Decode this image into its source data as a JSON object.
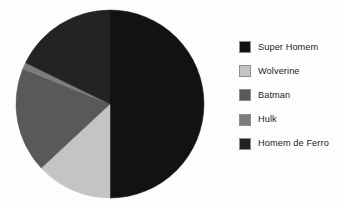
{
  "chart_data": {
    "type": "pie",
    "title": "",
    "categories": [
      "Super Homem",
      "Wolverine",
      "Batman",
      "Hulk",
      "Homem de Ferro"
    ],
    "values": [
      50,
      13,
      18,
      1,
      18
    ],
    "units": "percent",
    "start_angle_deg": 0,
    "direction": "clockwise",
    "legend_position": "right",
    "grid": false,
    "slices": [
      {
        "label": "Super Homem",
        "value": 50,
        "start_deg": 0,
        "end_deg": 180,
        "color": "#121212"
      },
      {
        "label": "Wolverine",
        "value": 13,
        "start_deg": 180,
        "end_deg": 227,
        "color": "#c4c4c4"
      },
      {
        "label": "Batman",
        "value": 18,
        "start_deg": 227,
        "end_deg": 292,
        "color": "#595959"
      },
      {
        "label": "Hulk",
        "value": 1,
        "start_deg": 292,
        "end_deg": 296,
        "color": "#7d7d7d"
      },
      {
        "label": "Homem de Ferro",
        "value": 18,
        "start_deg": 296,
        "end_deg": 360,
        "color": "#232323"
      }
    ]
  },
  "legend": {
    "items": [
      {
        "label": "Super Homem",
        "color": "#121212"
      },
      {
        "label": "Wolverine",
        "color": "#c4c4c4"
      },
      {
        "label": "Batman",
        "color": "#595959"
      },
      {
        "label": "Hulk",
        "color": "#7d7d7d"
      },
      {
        "label": "Homem de Ferro",
        "color": "#232323"
      }
    ]
  },
  "pie_geometry": {
    "cx": 110,
    "cy": 104,
    "r": 94
  },
  "colors": {
    "background": "#fdfdfd",
    "swatch_border": "#8d8d8d",
    "text": "#1d1d1d"
  }
}
